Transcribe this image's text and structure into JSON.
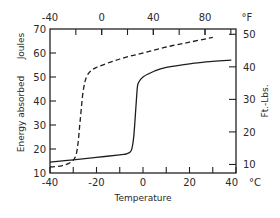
{
  "chart_data": {
    "type": "line",
    "title": "",
    "xlabel": "Temperature",
    "xunit": "°C",
    "ylabel_left": "Energy absorbed",
    "ylabel_left_unit": "Joules",
    "ylabel_right_unit": "Ft.-Lbs.",
    "xlabel_top_unit": "°F",
    "xlim": [
      -40,
      40
    ],
    "ylim": [
      10,
      70
    ],
    "x_ticks": [
      -40,
      -20,
      0,
      20,
      40
    ],
    "x_minor_ticks": [
      -30,
      -10,
      10,
      30
    ],
    "y_ticks_left": [
      10,
      20,
      30,
      40,
      50,
      60,
      70
    ],
    "top_ticks_F": [
      -40,
      0,
      40,
      80
    ],
    "right_ticks_ftlb": [
      10,
      20,
      30,
      40,
      50
    ],
    "grid": false,
    "legend": null,
    "series": [
      {
        "name": "solid",
        "style": "solid",
        "x": [
          -40,
          -30,
          -20,
          -10,
          -7,
          -5,
          -4,
          -3,
          -2.5,
          -2,
          0,
          5,
          10,
          20,
          30,
          38
        ],
        "y": [
          14.5,
          15.5,
          16.5,
          17.6,
          18,
          19.5,
          25,
          38,
          45,
          47.5,
          50,
          52.5,
          54,
          55.5,
          56.5,
          57
        ]
      },
      {
        "name": "dashed",
        "style": "dashed",
        "x": [
          -40,
          -35,
          -31,
          -29,
          -28,
          -27,
          -26,
          -25,
          -24,
          -23,
          -20,
          -10,
          0,
          10,
          20,
          30
        ],
        "y": [
          12.5,
          13,
          14.5,
          17,
          22,
          32,
          42,
          48,
          50.5,
          52,
          54,
          57.5,
          60,
          62.5,
          64.5,
          66.5
        ]
      }
    ]
  },
  "labels": {
    "top_unit": "°F",
    "right_title": "Ft.-Lbs.",
    "left_title_main": "Energy absorbed",
    "left_title_unit": "Joules",
    "bottom_title": "Temperature",
    "bottom_unit": "°C"
  }
}
